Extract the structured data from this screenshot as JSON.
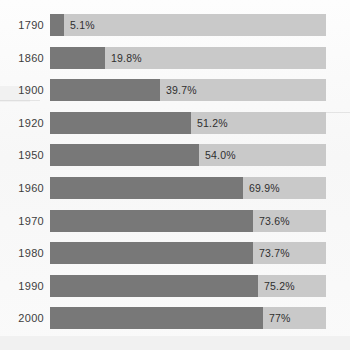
{
  "chart_data": {
    "type": "bar",
    "title": "",
    "subtitle": "",
    "xlabel": "",
    "ylabel": "",
    "orientation": "horizontal",
    "grid": false,
    "legend": null,
    "legend_position": "none",
    "xlim": [
      0,
      100
    ],
    "value_unit": "%",
    "categories": [
      "1790",
      "1860",
      "1900",
      "1920",
      "1950",
      "1960",
      "1970",
      "1980",
      "1990",
      "2000"
    ],
    "values": [
      5.1,
      19.8,
      39.7,
      51.2,
      54.0,
      69.9,
      73.6,
      73.7,
      75.2,
      77.0
    ],
    "value_labels": [
      "5.1%",
      "19.8%",
      "39.7%",
      "51.2%",
      "54.0%",
      "69.9%",
      "73.6%",
      "73.7%",
      "75.2%",
      "77%"
    ],
    "colors": {
      "bar_fill": "#787878",
      "bar_track": "#c9c9c9",
      "background": "#fbfbfb",
      "label_text": "#2f2f2f",
      "category_text": "#3d3d3d"
    }
  },
  "rows": [
    {
      "year": "1790",
      "value": 5.1,
      "value_label": "5.1%"
    },
    {
      "year": "1860",
      "value": 19.8,
      "value_label": "19.8%"
    },
    {
      "year": "1900",
      "value": 39.7,
      "value_label": "39.7%"
    },
    {
      "year": "1920",
      "value": 51.2,
      "value_label": "51.2%"
    },
    {
      "year": "1950",
      "value": 54.0,
      "value_label": "54.0%"
    },
    {
      "year": "1960",
      "value": 69.9,
      "value_label": "69.9%"
    },
    {
      "year": "1970",
      "value": 73.6,
      "value_label": "73.6%"
    },
    {
      "year": "1980",
      "value": 73.7,
      "value_label": "73.7%"
    },
    {
      "year": "1990",
      "value": 75.2,
      "value_label": "75.2%"
    },
    {
      "year": "2000",
      "value": 77.0,
      "value_label": "77%"
    }
  ]
}
